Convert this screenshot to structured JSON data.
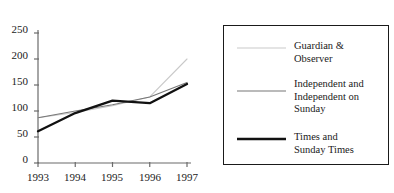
{
  "chart_data": {
    "type": "line",
    "title": "",
    "subtitle": "",
    "xlabel": "",
    "ylabel": "",
    "x": [
      1993,
      1994,
      1995,
      1996,
      1997
    ],
    "xticklabels": [
      "1993",
      "1994",
      "1995",
      "1996",
      "1997"
    ],
    "yticklabels": [
      "0",
      "50",
      "100",
      "150",
      "200",
      "250"
    ],
    "yticks": [
      0,
      50,
      100,
      150,
      200,
      250
    ],
    "xlim": [
      1993,
      1997
    ],
    "ylim": [
      0,
      250
    ],
    "grid": false,
    "legend_position": "right-outside",
    "series": [
      {
        "name": "Guardian & Observer",
        "values": [
          87,
          97,
          110,
          127,
          200
        ],
        "color": "#c9c9c9",
        "width": 1.1
      },
      {
        "name": "Independent and Independent on Sunday",
        "values": [
          87,
          100,
          112,
          127,
          155
        ],
        "color": "#777777",
        "width": 1.1
      },
      {
        "name": "Times and Sunday Times",
        "values": [
          61,
          96,
          120,
          115,
          152
        ],
        "color": "#111111",
        "width": 2.3
      }
    ]
  },
  "legend": {
    "entries": [
      {
        "label": "Guardian &\nObserver",
        "swatch_name": "legend-line-guardian"
      },
      {
        "label": "Independent and\nIndependent on\nSunday",
        "swatch_name": "legend-line-independent"
      },
      {
        "label": "Times and\nSunday Times",
        "swatch_name": "legend-line-times"
      }
    ]
  },
  "axes": {
    "y_tick_labels": [
      "250",
      "200",
      "150",
      "100",
      "50",
      "0"
    ],
    "x_tick_labels": [
      "1993",
      "1994",
      "1995",
      "1996",
      "1997"
    ]
  },
  "colors": {
    "background": "#ffffff",
    "axis": "#6b6b6b",
    "text": "#1a1a1a",
    "series_guardian": "#c9c9c9",
    "series_independent": "#777777",
    "series_times": "#111111"
  }
}
